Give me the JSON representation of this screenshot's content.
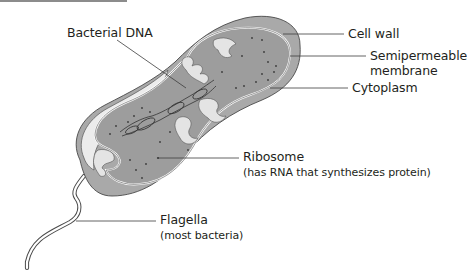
{
  "diagram": {
    "colors": {
      "cell_wall": "#a8a8a8",
      "membrane_gap": "#e6e6e6",
      "cytoplasm": "#9d9d9d",
      "outline": "#4a4a4a",
      "leader_line": "#3c3c3c",
      "text": "#231f20",
      "top_bar": "#8c8c8c"
    },
    "labels": {
      "bacterial_dna": "Bacterial DNA",
      "cell_wall": "Cell wall",
      "membrane_line1": "Semipermeable",
      "membrane_line2": "membrane",
      "cytoplasm": "Cytoplasm",
      "ribosome": "Ribosome",
      "ribosome_note": "(has RNA that synthesizes protein)",
      "flagella": "Flagella",
      "flagella_note": "(most bacteria)"
    }
  }
}
